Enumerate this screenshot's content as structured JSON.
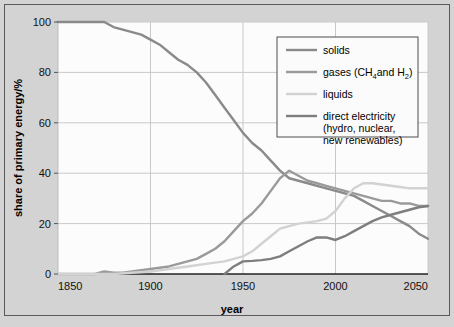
{
  "figure": {
    "background_color": "#d3d3d3",
    "plot_background_color": "#fcfcfc",
    "frame_color": "#5a5a5a"
  },
  "chart_data": {
    "type": "line",
    "title": "",
    "xlabel": "year",
    "ylabel": "share of primary energy/%",
    "xlim": [
      1850,
      2050
    ],
    "ylim": [
      0,
      100
    ],
    "xticks": [
      1850,
      1900,
      1950,
      2000,
      2050
    ],
    "yticks": [
      0,
      20,
      40,
      60,
      80,
      100
    ],
    "xtick_labels": [
      "1850",
      "1900",
      "1950",
      "2000",
      "2050"
    ],
    "ytick_labels": [
      "0",
      "20",
      "40",
      "60",
      "80",
      "100"
    ],
    "grid": true,
    "legend_position": "top-right",
    "series": [
      {
        "name": "solids",
        "label": "solids",
        "color": "#8a8a8a",
        "x": [
          1850,
          1860,
          1870,
          1875,
          1880,
          1885,
          1890,
          1895,
          1900,
          1905,
          1910,
          1915,
          1920,
          1925,
          1930,
          1935,
          1940,
          1945,
          1950,
          1955,
          1960,
          1965,
          1970,
          1975,
          1980,
          1985,
          1990,
          1995,
          2000,
          2005,
          2010,
          2015,
          2020,
          2025,
          2030,
          2035,
          2040,
          2045,
          2050
        ],
        "y": [
          100,
          100,
          100,
          100,
          98,
          97,
          96,
          95,
          93,
          91,
          88,
          85,
          83,
          80,
          76,
          71,
          66,
          61,
          56,
          52,
          49,
          45,
          41,
          38,
          37,
          36,
          35,
          34,
          33,
          32,
          31,
          29,
          27,
          25,
          23,
          21,
          19,
          16,
          14
        ]
      },
      {
        "name": "gases",
        "label": "gases (CH4 and H2)",
        "label_base": "gases (CH",
        "label_sub1": "4",
        "label_mid": "and H",
        "label_sub2": "2",
        "label_end": ")",
        "color": "#9a9a9a",
        "x": [
          1850,
          1860,
          1870,
          1875,
          1880,
          1885,
          1890,
          1895,
          1900,
          1905,
          1910,
          1915,
          1920,
          1925,
          1930,
          1935,
          1940,
          1945,
          1950,
          1955,
          1960,
          1965,
          1970,
          1975,
          1980,
          1985,
          1990,
          1995,
          2000,
          2005,
          2010,
          2015,
          2020,
          2025,
          2030,
          2035,
          2040,
          2045,
          2050
        ],
        "y": [
          0,
          0,
          0,
          1,
          0.5,
          0.5,
          1,
          1.5,
          2,
          2.5,
          3,
          4,
          5,
          6,
          8,
          10,
          13,
          17,
          21,
          24,
          28,
          33,
          38,
          41,
          39,
          37,
          36,
          35,
          34,
          33,
          32,
          31,
          30,
          29,
          29,
          28,
          28,
          27,
          27
        ]
      },
      {
        "name": "liquids",
        "label": "liquids",
        "color": "#d2d2d2",
        "x": [
          1850,
          1860,
          1870,
          1880,
          1890,
          1900,
          1910,
          1920,
          1930,
          1940,
          1950,
          1955,
          1960,
          1965,
          1970,
          1975,
          1980,
          1985,
          1990,
          1995,
          2000,
          2005,
          2010,
          2015,
          2020,
          2025,
          2030,
          2035,
          2040,
          2045,
          2050
        ],
        "y": [
          0,
          0,
          0,
          0,
          0.5,
          1,
          2,
          3,
          4,
          5,
          7,
          9,
          12,
          15,
          18,
          19,
          20,
          20.5,
          21,
          22,
          25,
          30,
          34,
          36,
          36,
          35.5,
          35,
          34.5,
          34,
          34,
          34
        ]
      },
      {
        "name": "direct-electricity",
        "label": "direct electricity",
        "label_line2": "(hydro, nuclear,",
        "label_line3": "new renewables)",
        "color": "#7e7e7e",
        "x": [
          1940,
          1945,
          1950,
          1955,
          1960,
          1965,
          1970,
          1975,
          1980,
          1985,
          1990,
          1995,
          2000,
          2005,
          2010,
          2015,
          2020,
          2025,
          2030,
          2035,
          2040,
          2045,
          2050
        ],
        "y": [
          0,
          3,
          5,
          5.2,
          5.5,
          6,
          7,
          9,
          11,
          13,
          14.5,
          14.5,
          13.5,
          15,
          17,
          19,
          21,
          22.5,
          23.5,
          24.5,
          25.5,
          26.5,
          27
        ]
      }
    ],
    "legend": [
      {
        "key": "solids",
        "text": "solids",
        "color": "#8a8a8a"
      },
      {
        "key": "gases",
        "text": "gases (CH4and H2)",
        "color": "#9a9a9a"
      },
      {
        "key": "liquids",
        "text": "liquids",
        "color": "#d2d2d2"
      },
      {
        "key": "direct-electricity",
        "text": "direct electricity",
        "color": "#7e7e7e"
      }
    ]
  }
}
